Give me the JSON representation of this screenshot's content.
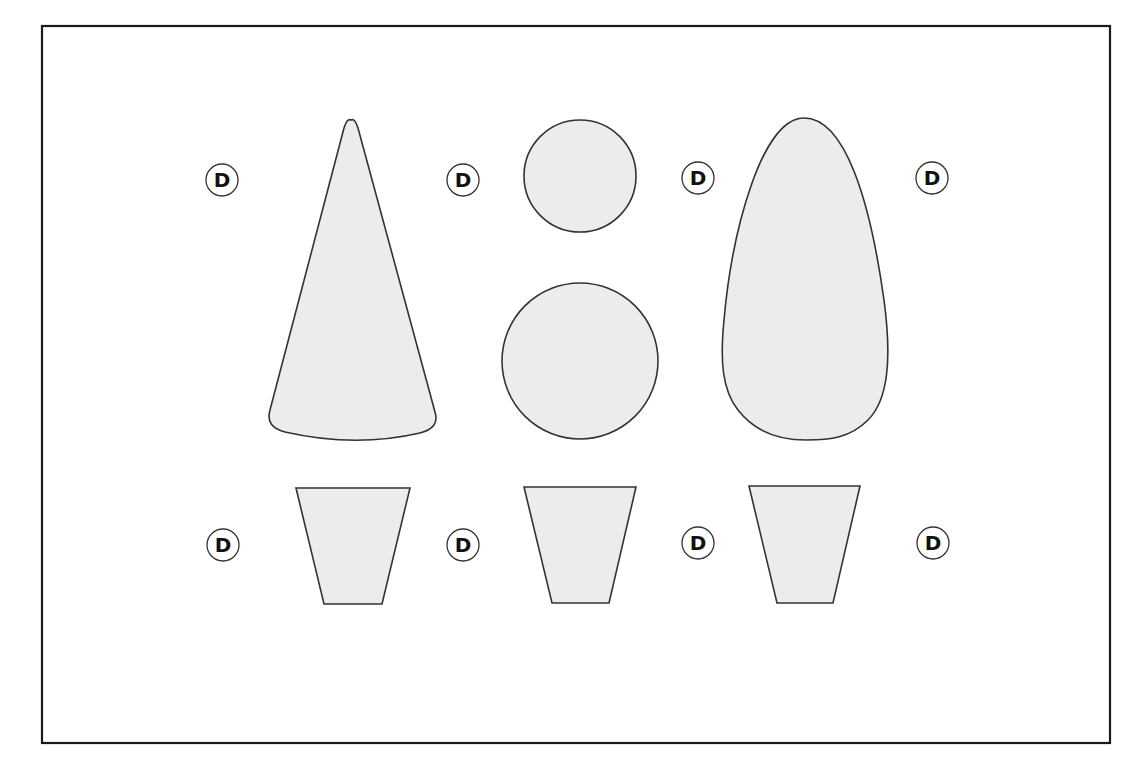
{
  "diagram": {
    "frame": {
      "x": 42,
      "y": 26,
      "width": 1068,
      "height": 717,
      "stroke": "#1a1a1a"
    },
    "shape_fill": "#ececec",
    "shape_stroke": "#333333",
    "shapes": [
      {
        "id": "cone",
        "type": "cone-profile"
      },
      {
        "id": "small-circle",
        "type": "circle",
        "cx": 580,
        "cy": 176,
        "r": 56
      },
      {
        "id": "large-circle",
        "type": "circle",
        "cx": 580,
        "cy": 361,
        "r": 78
      },
      {
        "id": "egg",
        "type": "egg-profile"
      },
      {
        "id": "trapezoid-1",
        "type": "trapezoid",
        "points": [
          [
            296,
            488
          ],
          [
            410,
            488
          ],
          [
            382,
            604
          ],
          [
            324,
            604
          ]
        ]
      },
      {
        "id": "trapezoid-2",
        "type": "trapezoid",
        "points": [
          [
            524,
            487
          ],
          [
            636,
            487
          ],
          [
            609,
            603
          ],
          [
            552,
            603
          ]
        ]
      },
      {
        "id": "trapezoid-3",
        "type": "trapezoid",
        "points": [
          [
            749,
            486
          ],
          [
            860,
            486
          ],
          [
            833,
            603
          ],
          [
            777,
            603
          ]
        ]
      }
    ],
    "labels": [
      {
        "text": "D",
        "cx": 222,
        "cy": 180
      },
      {
        "text": "D",
        "cx": 463,
        "cy": 180
      },
      {
        "text": "D",
        "cx": 698,
        "cy": 178
      },
      {
        "text": "D",
        "cx": 932,
        "cy": 178
      },
      {
        "text": "D",
        "cx": 223,
        "cy": 545
      },
      {
        "text": "D",
        "cx": 463,
        "cy": 545
      },
      {
        "text": "D",
        "cx": 698,
        "cy": 543
      },
      {
        "text": "D",
        "cx": 933,
        "cy": 543
      }
    ]
  }
}
